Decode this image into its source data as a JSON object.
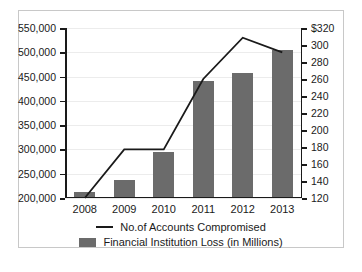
{
  "chart_data": {
    "type": "bar",
    "title": "",
    "subtitle": "",
    "xlabel": "",
    "ylabel": "",
    "categories": [
      "2008",
      "2009",
      "2010",
      "2011",
      "2012",
      "2013"
    ],
    "grid": true,
    "legend_position": "bottom",
    "series": [
      {
        "name": "No.of Accounts Compromised",
        "type": "line",
        "axis": "left",
        "color": "#1a1a1a",
        "values": [
          200000,
          300000,
          300000,
          445000,
          530000,
          500000
        ]
      },
      {
        "name": "Financial Institution Loss (in Millions)",
        "type": "bar",
        "axis": "right",
        "color": "#6b6b6b",
        "values": [
          125,
          140,
          172,
          256,
          265,
          292
        ]
      }
    ],
    "left_axis": {
      "label": "",
      "ylim": [
        200000,
        550000
      ],
      "ticks": [
        200000,
        250000,
        300000,
        350000,
        400000,
        450000,
        500000,
        550000
      ],
      "tick_labels": [
        "200,000",
        "250,000",
        "300,000",
        "350,000",
        "400,000",
        "450,000",
        "500,000",
        "550,000"
      ]
    },
    "right_axis": {
      "label": "",
      "ylim": [
        120,
        320
      ],
      "ticks": [
        120,
        140,
        160,
        180,
        200,
        220,
        240,
        260,
        280,
        300,
        320
      ],
      "tick_labels": [
        "120",
        "140",
        "160",
        "180",
        "200",
        "220",
        "240",
        "260",
        "280",
        "300",
        "$320"
      ]
    },
    "legend": [
      {
        "label": "No.of Accounts Compromised",
        "marker": "line",
        "color": "#1a1a1a"
      },
      {
        "label": "Financial Institution Loss (in Millions)",
        "marker": "bar",
        "color": "#6b6b6b"
      }
    ]
  },
  "colors": {
    "bar": "#6b6b6b",
    "line": "#1a1a1a",
    "grid": "#ececec",
    "frame": "#c8c8c8",
    "background": "#ffffff"
  }
}
